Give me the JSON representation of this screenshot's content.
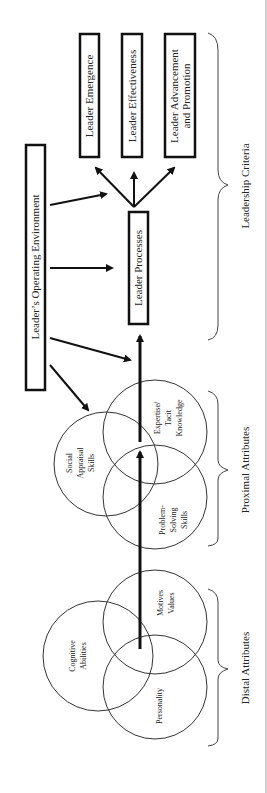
{
  "diagram": {
    "title": "",
    "colors": {
      "ink": "#111111",
      "text": "#222222",
      "background": "#ffffff"
    },
    "groups": {
      "distal": {
        "label": "Distal Attributes"
      },
      "proximal": {
        "label": "Proximal Attributes"
      },
      "criteria": {
        "label": "Leadership Criteria"
      }
    },
    "circles": {
      "cognitive": {
        "line1": "Cognitive",
        "line2": "Abilities"
      },
      "personality": {
        "line1": "Personality"
      },
      "motives": {
        "line1": "Motives",
        "line2": "Values"
      },
      "social": {
        "line1": "Social",
        "line2": "Appraisal",
        "line3": "Skills"
      },
      "problem": {
        "line1": "Problem-",
        "line2": "Solving",
        "line3": "Skills"
      },
      "expertise": {
        "line1": "Expertise/",
        "line2": "Tacit",
        "line3": "Knowledge"
      }
    },
    "boxes": {
      "environment": {
        "label": "Leader’s Operating Environment"
      },
      "processes": {
        "label": "Leader Processes"
      },
      "emergence": {
        "label": "Leader Emergence"
      },
      "effectiveness": {
        "label": "Leader Effectiveness"
      },
      "advancement": {
        "line1": "Leader Advancement",
        "line2": "and Promotion"
      }
    }
  }
}
